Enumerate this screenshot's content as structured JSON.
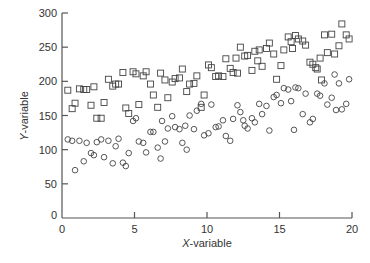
{
  "chart_data": {
    "type": "scatter",
    "title": "",
    "xlabel": "X-variable",
    "ylabel": "Y-variable",
    "xlim": [
      0,
      20
    ],
    "ylim": [
      0,
      300
    ],
    "xticks": [
      0,
      5,
      10,
      15,
      20
    ],
    "yticks": [
      0,
      50,
      100,
      150,
      200,
      250,
      300
    ],
    "grid": false,
    "legend": null,
    "series": [
      {
        "name": "squares",
        "marker": "square",
        "points": [
          [
            0.4,
            187
          ],
          [
            0.7,
            160
          ],
          [
            0.9,
            168
          ],
          [
            1.2,
            189
          ],
          [
            1.5,
            188
          ],
          [
            1.7,
            188
          ],
          [
            2.0,
            165
          ],
          [
            2.2,
            192
          ],
          [
            2.4,
            146
          ],
          [
            2.7,
            146
          ],
          [
            2.9,
            169
          ],
          [
            3.2,
            203
          ],
          [
            3.5,
            193
          ],
          [
            3.7,
            196
          ],
          [
            3.9,
            196
          ],
          [
            4.2,
            213
          ],
          [
            4.4,
            161
          ],
          [
            4.6,
            153
          ],
          [
            4.9,
            214
          ],
          [
            5.1,
            211
          ],
          [
            5.3,
            166
          ],
          [
            5.6,
            208
          ],
          [
            5.8,
            214
          ],
          [
            6.1,
            196
          ],
          [
            6.3,
            180
          ],
          [
            6.6,
            162
          ],
          [
            6.8,
            212
          ],
          [
            7.1,
            202
          ],
          [
            7.3,
            176
          ],
          [
            7.6,
            199
          ],
          [
            7.8,
            204
          ],
          [
            8.1,
            205
          ],
          [
            8.3,
            218
          ],
          [
            8.6,
            185
          ],
          [
            8.8,
            196
          ],
          [
            9.1,
            197
          ],
          [
            9.3,
            208
          ],
          [
            9.6,
            162
          ],
          [
            9.8,
            180
          ],
          [
            10.1,
            224
          ],
          [
            10.3,
            220
          ],
          [
            10.6,
            207
          ],
          [
            10.8,
            208
          ],
          [
            11.1,
            207
          ],
          [
            11.3,
            233
          ],
          [
            11.6,
            219
          ],
          [
            11.8,
            213
          ],
          [
            12.1,
            212
          ],
          [
            12.3,
            250
          ],
          [
            12.6,
            237
          ],
          [
            12.8,
            238
          ],
          [
            13.1,
            216
          ],
          [
            13.3,
            244
          ],
          [
            13.6,
            246
          ],
          [
            13.8,
            222
          ],
          [
            14.1,
            248
          ],
          [
            14.3,
            256
          ],
          [
            14.6,
            240
          ],
          [
            14.8,
            203
          ],
          [
            15.1,
            223
          ],
          [
            15.3,
            246
          ],
          [
            15.6,
            265
          ],
          [
            15.8,
            258
          ],
          [
            16.1,
            267
          ],
          [
            16.3,
            262
          ],
          [
            16.6,
            259
          ],
          [
            16.8,
            253
          ],
          [
            17.1,
            228
          ],
          [
            17.3,
            225
          ],
          [
            17.6,
            218
          ],
          [
            17.8,
            234
          ],
          [
            18.1,
            268
          ],
          [
            18.3,
            242
          ],
          [
            18.6,
            269
          ],
          [
            18.8,
            240
          ],
          [
            19.1,
            252
          ],
          [
            19.3,
            284
          ],
          [
            19.6,
            268
          ],
          [
            19.8,
            262
          ],
          [
            17.9,
            202
          ],
          [
            17.5,
            220
          ],
          [
            15.9,
            248
          ],
          [
            13.5,
            230
          ],
          [
            12.0,
            234
          ]
        ]
      },
      {
        "name": "circles",
        "marker": "circle",
        "points": [
          [
            0.4,
            115
          ],
          [
            0.7,
            113
          ],
          [
            0.9,
            70
          ],
          [
            1.2,
            113
          ],
          [
            1.5,
            83
          ],
          [
            1.7,
            110
          ],
          [
            2.0,
            95
          ],
          [
            2.2,
            92
          ],
          [
            2.4,
            111
          ],
          [
            2.7,
            115
          ],
          [
            2.9,
            89
          ],
          [
            3.2,
            113
          ],
          [
            3.5,
            80
          ],
          [
            3.7,
            105
          ],
          [
            3.9,
            116
          ],
          [
            4.2,
            81
          ],
          [
            4.4,
            76
          ],
          [
            4.6,
            95
          ],
          [
            4.9,
            142
          ],
          [
            5.1,
            146
          ],
          [
            5.3,
            112
          ],
          [
            5.6,
            110
          ],
          [
            5.8,
            96
          ],
          [
            6.1,
            126
          ],
          [
            6.3,
            126
          ],
          [
            6.6,
            103
          ],
          [
            6.8,
            87
          ],
          [
            7.1,
            112
          ],
          [
            7.3,
            131
          ],
          [
            7.6,
            149
          ],
          [
            7.8,
            133
          ],
          [
            8.1,
            130
          ],
          [
            8.3,
            110
          ],
          [
            8.6,
            100
          ],
          [
            8.8,
            150
          ],
          [
            9.1,
            130
          ],
          [
            9.3,
            157
          ],
          [
            9.6,
            167
          ],
          [
            9.8,
            121
          ],
          [
            10.1,
            124
          ],
          [
            10.3,
            166
          ],
          [
            10.6,
            133
          ],
          [
            10.8,
            134
          ],
          [
            11.1,
            143
          ],
          [
            11.3,
            120
          ],
          [
            11.6,
            113
          ],
          [
            11.8,
            145
          ],
          [
            12.1,
            165
          ],
          [
            12.3,
            155
          ],
          [
            12.6,
            135
          ],
          [
            12.8,
            131
          ],
          [
            13.1,
            146
          ],
          [
            13.3,
            140
          ],
          [
            13.6,
            167
          ],
          [
            13.8,
            152
          ],
          [
            14.1,
            164
          ],
          [
            14.3,
            128
          ],
          [
            14.6,
            177
          ],
          [
            14.8,
            180
          ],
          [
            15.1,
            168
          ],
          [
            15.3,
            190
          ],
          [
            15.6,
            188
          ],
          [
            15.8,
            171
          ],
          [
            16.1,
            191
          ],
          [
            16.3,
            190
          ],
          [
            16.6,
            152
          ],
          [
            16.8,
            182
          ],
          [
            17.1,
            140
          ],
          [
            17.3,
            145
          ],
          [
            17.6,
            182
          ],
          [
            17.8,
            179
          ],
          [
            18.1,
            197
          ],
          [
            18.3,
            166
          ],
          [
            18.6,
            176
          ],
          [
            18.8,
            210
          ],
          [
            19.1,
            197
          ],
          [
            19.3,
            159
          ],
          [
            19.6,
            167
          ],
          [
            19.8,
            203
          ],
          [
            18.9,
            158
          ],
          [
            16.0,
            129
          ],
          [
            12.5,
            143
          ],
          [
            8.5,
            135
          ],
          [
            6.9,
            142
          ]
        ]
      }
    ]
  },
  "axes": {
    "x_label_italic": "X",
    "x_label_rest": "-variable",
    "y_label_italic": "Y",
    "y_label_rest": "-variable",
    "x_tick_labels": [
      "0",
      "5",
      "10",
      "15",
      "20"
    ],
    "y_tick_labels": [
      "0",
      "50",
      "100",
      "150",
      "200",
      "250",
      "300"
    ]
  },
  "colors": {
    "axis": "#555555",
    "marker": "#444444",
    "text": "#333333",
    "background": "#ffffff"
  }
}
